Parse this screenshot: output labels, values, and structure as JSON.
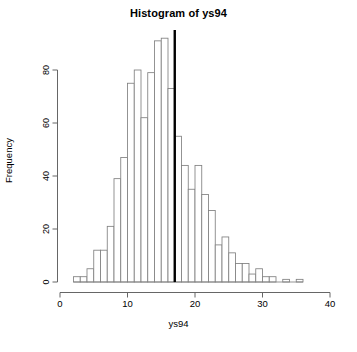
{
  "chart_data": {
    "type": "bar",
    "title": "Histogram of ys94",
    "xlabel": "ys94",
    "ylabel": "Frequency",
    "xlim": [
      0,
      40
    ],
    "ylim": [
      0,
      93
    ],
    "xticks": [
      0,
      10,
      20,
      30,
      40
    ],
    "yticks": [
      0,
      20,
      40,
      60,
      80
    ],
    "grid": false,
    "legend": null,
    "bin_width": 1,
    "bin_starts": [
      2,
      3,
      4,
      5,
      6,
      7,
      8,
      9,
      10,
      11,
      12,
      13,
      14,
      15,
      16,
      17,
      18,
      19,
      20,
      21,
      22,
      23,
      24,
      25,
      26,
      27,
      28,
      29,
      30,
      31,
      32,
      33,
      34,
      35
    ],
    "categories": [
      "2-3",
      "3-4",
      "4-5",
      "5-6",
      "6-7",
      "7-8",
      "8-9",
      "9-10",
      "10-11",
      "11-12",
      "12-13",
      "13-14",
      "14-15",
      "15-16",
      "16-17",
      "17-18",
      "18-19",
      "19-20",
      "20-21",
      "21-22",
      "22-23",
      "23-24",
      "24-25",
      "25-26",
      "26-27",
      "27-28",
      "28-29",
      "29-30",
      "30-31",
      "31-32",
      "32-33",
      "33-34",
      "34-35",
      "35-36"
    ],
    "values": [
      2,
      2,
      5,
      12,
      12,
      21,
      39,
      47,
      75,
      80,
      62,
      79,
      91,
      92,
      73,
      55,
      44,
      35,
      44,
      33,
      27,
      14,
      17,
      11,
      7,
      7,
      3,
      5,
      2,
      2,
      0,
      1,
      0,
      1
    ],
    "bar_fill": "#ffffff",
    "bar_stroke": "#808080",
    "annotations": [
      {
        "name": "vertical-reference-line",
        "type": "vline",
        "x": 17,
        "color": "#000000",
        "width": 2.4
      }
    ]
  }
}
